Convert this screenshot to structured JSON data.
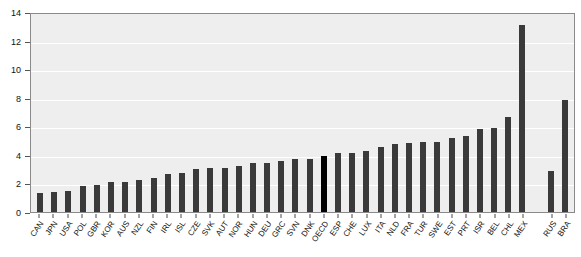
{
  "chart_data": {
    "type": "bar",
    "title": "",
    "xlabel": "",
    "ylabel": "",
    "ylim": [
      0,
      14
    ],
    "ytick_labels": [
      "0",
      "2",
      "4",
      "6",
      "8",
      "10",
      "12",
      "14"
    ],
    "ytick_values": [
      0,
      2,
      4,
      6,
      8,
      10,
      12,
      14
    ],
    "grid": true,
    "legend": "none",
    "highlight_category": "OECD",
    "bar_color": "#3a3a3a",
    "highlight_color": "#000000",
    "plot_background": "#eeeeee",
    "categories": [
      "CAN",
      "JPN",
      "USA",
      "POL",
      "GBR",
      "KOR",
      "AUS",
      "NZL",
      "FIN",
      "IRL",
      "ISL",
      "CZE",
      "SVK",
      "AUT",
      "NOR",
      "HUN",
      "DEU",
      "GRC",
      "SVN",
      "DNK",
      "OECD",
      "ESP",
      "CHE",
      "LUX",
      "ITA",
      "NLD",
      "FRA",
      "TUR",
      "SWE",
      "EST",
      "PRT",
      "ISR",
      "BEL",
      "CHL",
      "MEX",
      "",
      "RUS",
      "BRA"
    ],
    "values": [
      1.3,
      1.4,
      1.5,
      1.8,
      1.9,
      2.1,
      2.1,
      2.25,
      2.4,
      2.65,
      2.7,
      3.0,
      3.05,
      3.05,
      3.2,
      3.4,
      3.45,
      3.55,
      3.7,
      3.7,
      3.9,
      4.1,
      4.1,
      4.25,
      4.55,
      4.75,
      4.8,
      4.9,
      4.9,
      5.15,
      5.35,
      5.8,
      5.9,
      6.65,
      13.1,
      null,
      2.85,
      7.85
    ]
  }
}
